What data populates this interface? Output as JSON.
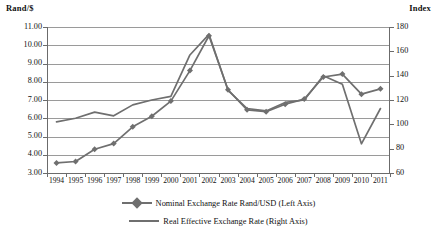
{
  "chart_data": {
    "type": "line",
    "title": "",
    "xlabel": "",
    "categories": [
      "1994",
      "1995",
      "1996",
      "1997",
      "1998",
      "1999",
      "2000",
      "2001",
      "2002",
      "2003",
      "2004",
      "2005",
      "2006",
      "2007",
      "2008",
      "2009",
      "2010",
      "2011"
    ],
    "grid": true,
    "legend_position": "bottom",
    "axes": {
      "left": {
        "label": "Rand/$",
        "ticks": [
          "3.00",
          "4.00",
          "5.00",
          "6.00",
          "7.00",
          "8.00",
          "9.00",
          "10.00",
          "11.00"
        ],
        "min": 3.0,
        "max": 11.0,
        "step": 1.0
      },
      "right": {
        "label": "Index",
        "ticks": [
          "60",
          "80",
          "100",
          "120",
          "140",
          "160",
          "180"
        ],
        "min": 60,
        "max": 180,
        "step": 20
      }
    },
    "series": [
      {
        "name": "Nominal Exchange Rate Rand/USD (Left Axis)",
        "axis": "left",
        "color": "#6f6f6f",
        "marker": "diamond",
        "values": [
          3.55,
          3.63,
          4.3,
          4.61,
          5.53,
          6.11,
          6.94,
          8.61,
          10.52,
          7.56,
          6.46,
          6.36,
          6.77,
          7.05,
          8.26,
          8.42,
          7.32,
          7.61
        ]
      },
      {
        "name": "Real Effective Exchange Rate (Right Axis)",
        "axis": "right",
        "color": "#6f6f6f",
        "marker": "none",
        "values": [
          102,
          105,
          110,
          107,
          116,
          120,
          123,
          157,
          174,
          128,
          113,
          111,
          118,
          120,
          140,
          133,
          84,
          113
        ]
      }
    ]
  },
  "legend": {
    "items": [
      {
        "label": "Nominal Exchange Rate Rand/USD (Left Axis)",
        "marker": "diamond"
      },
      {
        "label": "Real Effective Exchange Rate (Right Axis)",
        "marker": "line"
      }
    ]
  }
}
